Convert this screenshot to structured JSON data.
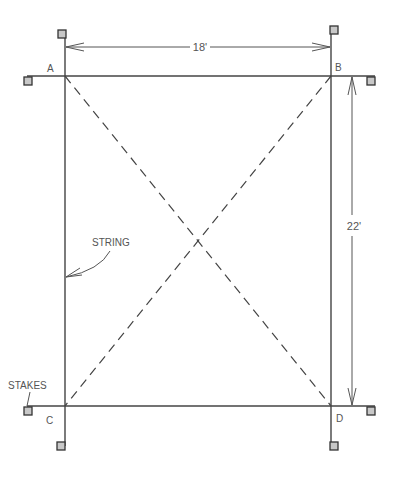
{
  "diagram": {
    "type": "layout staking plan",
    "corners": {
      "a": {
        "label": "A"
      },
      "b": {
        "label": "B"
      },
      "c": {
        "label": "C"
      },
      "d": {
        "label": "D"
      }
    },
    "dimensions": {
      "width": {
        "label": "18'",
        "value_ft": 18
      },
      "height": {
        "label": "22'",
        "value_ft": 22
      }
    },
    "callouts": {
      "string": {
        "label": "STRING"
      },
      "stakes": {
        "label": "STAKES"
      }
    },
    "colors": {
      "line": "#444444",
      "stake_fill": "#c8c8c8",
      "stake_border": "#333333",
      "text": "#555555"
    }
  }
}
